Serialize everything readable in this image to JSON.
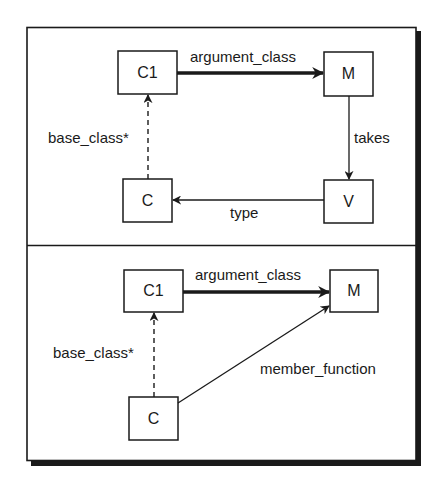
{
  "colors": {
    "ink": "#1a1a1a",
    "background": "#ffffff"
  },
  "top_panel": {
    "nodes": {
      "c1": {
        "label": "C1",
        "x": 118,
        "y": 51,
        "w": 59,
        "h": 43
      },
      "m": {
        "label": "M",
        "x": 324,
        "y": 52,
        "w": 49,
        "h": 44
      },
      "c": {
        "label": "C",
        "x": 123,
        "y": 179,
        "w": 49,
        "h": 43
      },
      "v": {
        "label": "V",
        "x": 324,
        "y": 180,
        "w": 49,
        "h": 43
      }
    },
    "edges": {
      "argument_class": {
        "label": "argument_class",
        "style": "thick"
      },
      "takes": {
        "label": "takes",
        "style": "solid"
      },
      "type": {
        "label": "type",
        "style": "solid"
      },
      "base_class": {
        "label": "base_class*",
        "style": "dashed"
      }
    }
  },
  "bottom_panel": {
    "nodes": {
      "c1": {
        "label": "C1",
        "x": 124,
        "y": 270,
        "w": 59,
        "h": 42
      },
      "m": {
        "label": "M",
        "x": 330,
        "y": 270,
        "w": 48,
        "h": 42
      },
      "c": {
        "label": "C",
        "x": 129,
        "y": 397,
        "w": 49,
        "h": 43
      }
    },
    "edges": {
      "argument_class": {
        "label": "argument_class",
        "style": "thick"
      },
      "base_class": {
        "label": "base_class*",
        "style": "dashed"
      },
      "member_function": {
        "label": "member_function",
        "style": "solid"
      }
    }
  }
}
